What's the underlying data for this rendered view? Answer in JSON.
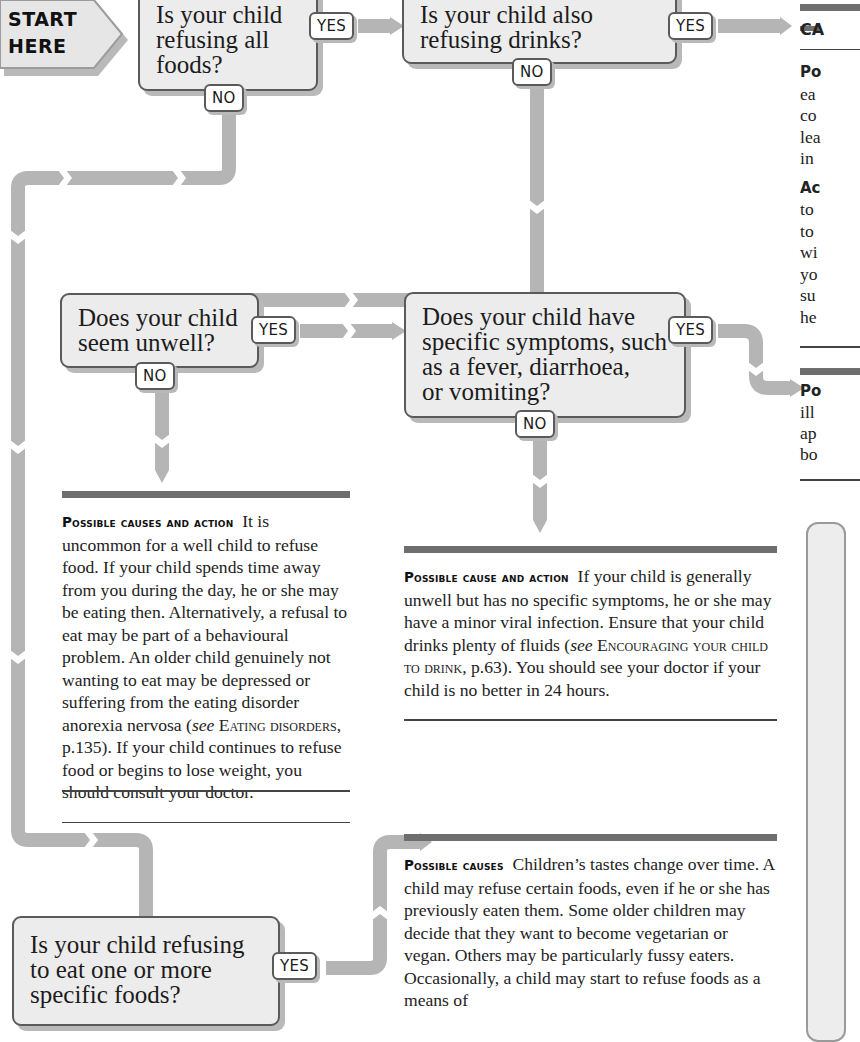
{
  "start": {
    "line1": "START",
    "line2": "HERE"
  },
  "questions": {
    "q1": {
      "lines": [
        "Is your child",
        "refusing all",
        "foods?"
      ],
      "yes": "YES",
      "no": "NO"
    },
    "q2": {
      "lines": [
        "Is your child also",
        "refusing drinks?"
      ],
      "yes": "YES",
      "no": "NO"
    },
    "q3": {
      "lines": [
        "Does your child",
        "seem unwell?"
      ],
      "yes": "YES",
      "no": "NO"
    },
    "q4": {
      "lines": [
        "Does your child have",
        "specific symptoms, such",
        "as a fever, diarrhoea,",
        "or vomiting?"
      ],
      "yes": "YES",
      "no": "NO"
    },
    "q5": {
      "lines": [
        "Is your child refusing",
        "to eat one or more",
        "specific foods?"
      ],
      "yes": "YES"
    }
  },
  "answers": {
    "right_top": {
      "heading_fragment": "CA",
      "lines": [
        "Po",
        "ea",
        "co",
        "lea",
        "in",
        "",
        "Ac",
        "to",
        "to",
        "wi",
        "yo",
        "su",
        "he"
      ]
    },
    "right_mid": {
      "lines": [
        "Po",
        "ill",
        "ap",
        "bo"
      ]
    },
    "unwell_no": {
      "lead": "Possible causes and action",
      "text": "It is uncommon for a well child to refuse food. If your child spends time away from you during the day, he or she may be eating then. Alternatively, a refusal to eat may be part of a behavioural problem. An older child genuinely not wanting to eat may be depressed or suffering from the eating disorder anorexia nervosa (",
      "see": "see",
      "ref": "Eating disorders",
      "text2": ", p.135). If your child continues to refuse food or begins to lose weight, you should consult your doctor."
    },
    "symptoms_no": {
      "lead": "Possible cause and action",
      "text": "If your child is generally unwell but has no specific symptoms, he or she may have a minor viral infection. Ensure that your child drinks plenty of fluids (",
      "see": "see",
      "ref": "Encouraging your child to drink",
      "text2": ", p.63). You should see your doctor if your child is no better in 24 hours."
    },
    "specific_yes": {
      "lead": "Possible causes",
      "text": "Children’s tastes change over time. A child may refuse certain foods, even if he or she has previously eaten them. Some older children may decide that they want to become vegetarian or vegan. Others may be particularly fussy eaters. Occasionally, a child may start to refuse foods as a means of"
    }
  },
  "colors": {
    "connector": "#b5b5b5",
    "box_fill": "#ececec",
    "box_border": "#5a5a5a",
    "bar": "#6e6e6e"
  }
}
